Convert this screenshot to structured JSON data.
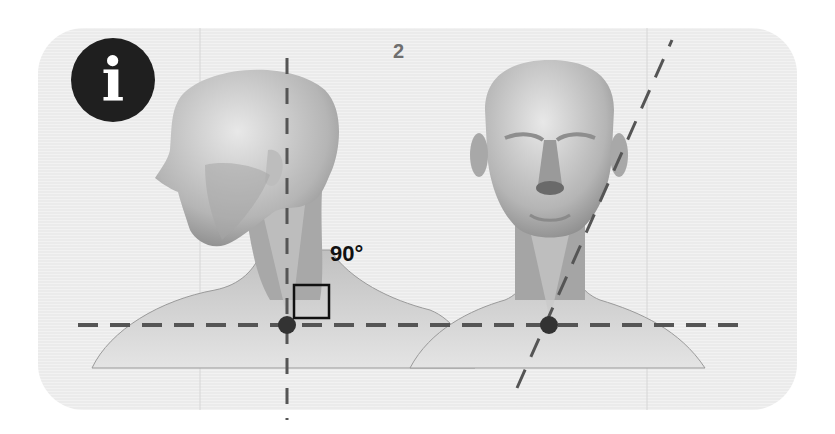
{
  "figure": {
    "badge": {
      "icon": "info-icon",
      "glyph": "i",
      "bg": "#1f1f1f",
      "fg": "#ffffff"
    },
    "step_number": "2",
    "angle_label": "90°",
    "views": [
      {
        "name": "side-view",
        "description": "Left profile of head, neck and shoulders"
      },
      {
        "name": "front-view",
        "description": "Front view of head, neck and shoulders"
      }
    ],
    "guides": {
      "horizontal_line_y": 325,
      "vertical_line_x": 287,
      "angled_line": {
        "from": [
          517,
          388
        ],
        "to": [
          672,
          40
        ]
      },
      "pivot_points": [
        [
          287,
          325
        ],
        [
          549,
          325
        ]
      ],
      "right_angle_marker": {
        "x": 294,
        "y": 285,
        "size": 35
      }
    },
    "colors": {
      "panel": "#ebebeb",
      "guide": "#555555",
      "pivot": "#333333",
      "skin_light": "#d4d4d4",
      "skin_dark": "#8a8a8a"
    }
  }
}
